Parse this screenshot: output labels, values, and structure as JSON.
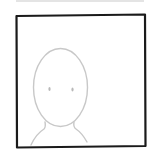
{
  "avatar_placeholder": {
    "label": "default profile picture placeholder",
    "frame_color": "#1a1a1a",
    "sketch_color": "#c8c8c8",
    "background_color": "#ffffff",
    "top_edge_color": "#e4e4e4"
  }
}
